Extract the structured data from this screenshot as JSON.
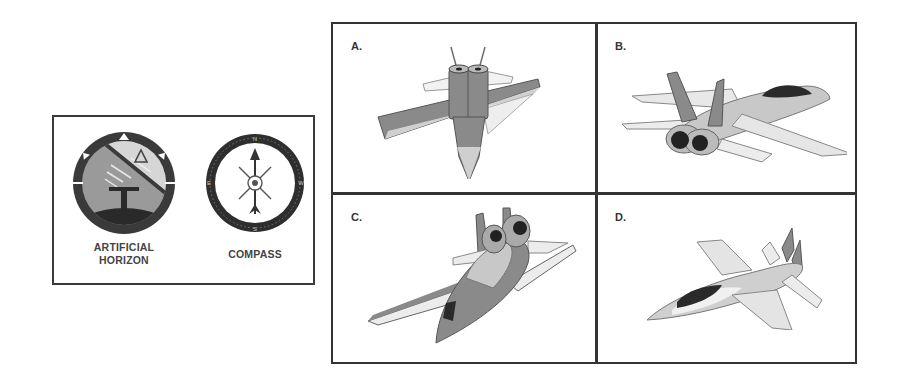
{
  "instruments": {
    "artificial_horizon": {
      "label_line1": "ARTIFICIAL",
      "label_line2": "HORIZON",
      "icon": "artificial-horizon-icon"
    },
    "compass": {
      "label": "COMPASS",
      "icon": "compass-icon"
    }
  },
  "options": [
    {
      "letter": "A.",
      "icon": "jet-rear-view-banked-icon"
    },
    {
      "letter": "B.",
      "icon": "jet-rear-quarter-left-icon"
    },
    {
      "letter": "C.",
      "icon": "jet-diving-banked-icon"
    },
    {
      "letter": "D.",
      "icon": "jet-front-quarter-left-icon"
    }
  ],
  "colors": {
    "border": "#333333",
    "dark": "#2e2e2e",
    "mid": "#8c8c8c",
    "light": "#c8c8c8",
    "pale": "#e6e6e6"
  }
}
